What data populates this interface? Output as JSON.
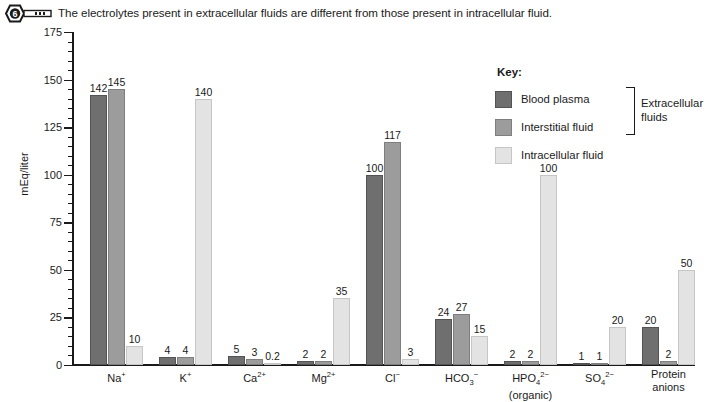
{
  "caption": {
    "icon": "key-icon",
    "badge_number": "6",
    "text": "The electrolytes present in extracellular fluids are different from those present in intracellular fluid."
  },
  "legend": {
    "title": "Key:",
    "items": [
      {
        "label": "Blood plasma",
        "color": "#6f6f6f"
      },
      {
        "label": "Interstitial fluid",
        "color": "#9c9c9c"
      },
      {
        "label": "Intracellular fluid",
        "color": "#e3e3e3"
      }
    ],
    "bracket_label": "Extracellular fluids"
  },
  "chart_data": {
    "type": "bar",
    "title": "",
    "xlabel": "",
    "ylabel": "mEq/liter",
    "ylim": [
      0,
      175
    ],
    "yticks": [
      0,
      25,
      50,
      75,
      100,
      125,
      150,
      175
    ],
    "ytick_labels": [
      "0",
      "25",
      "50",
      "75",
      "100",
      "125",
      "150",
      "175"
    ],
    "minor_tick_step": 5,
    "grid": false,
    "legend_position": "top-right",
    "categories": [
      "Na+",
      "K+",
      "Ca2+",
      "Mg2+",
      "Cl-",
      "HCO3-",
      "HPO42- (organic)",
      "SO42-",
      "Protein anions"
    ],
    "category_labels_html": [
      "Na<sup>+</sup>",
      "K<sup>+</sup>",
      "Ca<sup>2+</sup>",
      "Mg<sup>2+</sup>",
      "Cl<sup>−</sup>",
      "HCO<sub>3</sub><sup>−</sup>",
      "HPO<sub>4</sub><sup>2−</sup><br>(organic)",
      "SO<sub>4</sub><sup>2−</sup>",
      "Protein<br>anions"
    ],
    "series": [
      {
        "name": "Blood plasma",
        "color": "#6f6f6f",
        "values": [
          142,
          4,
          5,
          2,
          100,
          24,
          2,
          1,
          20
        ]
      },
      {
        "name": "Interstitial fluid",
        "color": "#9c9c9c",
        "values": [
          145,
          4,
          3,
          2,
          117,
          27,
          2,
          1,
          2
        ]
      },
      {
        "name": "Intracellular fluid",
        "color": "#e3e3e3",
        "values": [
          10,
          140,
          0.2,
          35,
          3,
          15,
          100,
          20,
          50
        ]
      }
    ],
    "value_labels": [
      [
        "142",
        "145",
        "10"
      ],
      [
        "4",
        "4",
        "140"
      ],
      [
        "5",
        "3",
        "0.2"
      ],
      [
        "2",
        "2",
        "35"
      ],
      [
        "100",
        "117",
        "3"
      ],
      [
        "24",
        "27",
        "15"
      ],
      [
        "2",
        "2",
        "100"
      ],
      [
        "1",
        "1",
        "20"
      ],
      [
        "20",
        "2",
        "50"
      ]
    ]
  }
}
